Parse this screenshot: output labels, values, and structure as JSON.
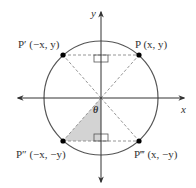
{
  "diagram": {
    "type": "unit-circle-symmetry",
    "axes": {
      "x_label": "x",
      "y_label": "y"
    },
    "angle_label": "θ",
    "points": [
      {
        "id": "P",
        "label": "P (x, y)",
        "quadrant": 1
      },
      {
        "id": "P1",
        "label": "P′ (−x, y)",
        "quadrant": 2
      },
      {
        "id": "P2",
        "label": "P″ (−x, −y)",
        "quadrant": 3
      },
      {
        "id": "P3",
        "label": "P‴ (x, −y)",
        "quadrant": 4
      }
    ],
    "colors": {
      "line": "#333333",
      "dashed": "#8a8a8a",
      "shade": "#d3d3d3",
      "point": "#000000"
    }
  }
}
